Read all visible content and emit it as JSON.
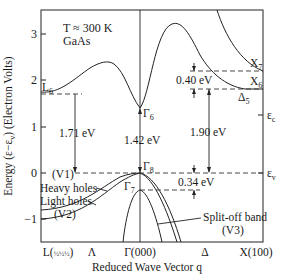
{
  "figure": {
    "annotation_temp": "T ≈ 300 K",
    "annotation_material": "GaAs",
    "y_axis_label": "Energy (ε−ε",
    "y_axis_label_sub": "v",
    "y_axis_label_tail": ") (Electron Volts)",
    "x_axis_label": "Reduced Wave Vector q",
    "y_ticks": [
      "3",
      "2",
      "1",
      "0",
      "−1"
    ],
    "x_ticks": {
      "L": "L(",
      "L_frac": "½½½",
      "L_close": ")",
      "Lambda": "Λ",
      "Gamma": "Γ(000)",
      "Delta": "Δ",
      "X": "X(100)"
    },
    "labels": {
      "L6": "L",
      "L6_sub": "6",
      "Gamma6": "Γ",
      "Gamma6_sub": "6",
      "Gamma8": "Γ",
      "Gamma8_sub": "8",
      "Gamma7": "Γ",
      "Gamma7_sub": "7",
      "X7": "X",
      "X7_sub": "7",
      "X6": "X",
      "X6_sub": "6",
      "Delta5": "Δ",
      "Delta5_sub": "5",
      "eps_c": "ε",
      "eps_c_sub": "c",
      "eps_v": "ε",
      "eps_v_sub": "v",
      "V1": "(V1)",
      "heavy_holes": "Heavy holes",
      "light_holes": "Light holes",
      "V2": "(V2)",
      "split_off": "Split-off band",
      "V3": "(V3)"
    },
    "energy_gaps": {
      "L_gap": "1.71 eV",
      "Gamma_gap": "1.42 eV",
      "X_gap": "1.90 eV",
      "X_split": "0.40 eV",
      "spin_orbit": "0.34 eV"
    }
  }
}
